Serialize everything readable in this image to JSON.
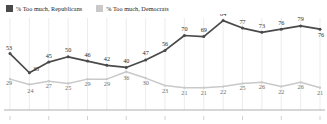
{
  "legend": {
    "items": [
      {
        "label": "% Too much, Republicans",
        "color": "#4a4a4a",
        "icon": "square-swatch-icon"
      },
      {
        "label": "% Too much, Democrats",
        "color": "#c9c9c9",
        "icon": "square-swatch-icon"
      }
    ]
  },
  "chart_data": {
    "type": "line",
    "title": "",
    "subtitle": "",
    "xlabel": "",
    "ylabel": "",
    "ylim": [
      0,
      100
    ],
    "grid": "vertical",
    "legend_position": "top-left",
    "x": [
      1,
      2,
      3,
      4,
      5,
      6,
      7,
      8,
      9,
      10,
      11,
      12,
      13,
      14,
      15,
      16,
      17
    ],
    "categories": [
      "",
      "",
      "",
      "",
      "",
      "",
      "",
      "",
      "",
      "",
      "",
      "",
      "",
      "",
      "",
      "",
      ""
    ],
    "series": [
      {
        "name": "% Too much, Republicans",
        "color": "#4a4a4a",
        "values": [
          53,
          35,
          45,
          50,
          46,
          42,
          40,
          47,
          56,
          70,
          69,
          84,
          77,
          73,
          76,
          79,
          76
        ],
        "labels": [
          "53",
          "35",
          "45",
          "50",
          "46",
          "42",
          "40",
          "47",
          "56",
          "70",
          "69",
          "84",
          "77",
          "73",
          "76",
          "79",
          "76"
        ]
      },
      {
        "name": "% Too much, Democrats",
        "color": "#c9c9c9",
        "values": [
          29,
          24,
          27,
          25,
          29,
          29,
          36,
          30,
          23,
          21,
          21,
          22,
          25,
          26,
          22,
          26,
          21
        ],
        "labels": [
          "29",
          "24",
          "27",
          "25",
          "29",
          "29",
          "36",
          "30",
          "23",
          "21",
          "21",
          "22",
          "25",
          "26",
          "22",
          "26",
          "21"
        ]
      }
    ]
  }
}
